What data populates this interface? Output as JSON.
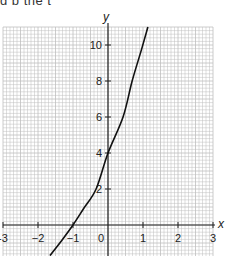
{
  "top_text": "g       p         the   t",
  "chart_data": {
    "type": "line",
    "title": "",
    "xlabel": "x",
    "ylabel": "y",
    "xlim": [
      -3,
      3
    ],
    "ylim": [
      -1.7,
      11
    ],
    "grid": true,
    "x_ticks": [
      -3,
      -2,
      -1,
      0,
      1,
      2,
      3
    ],
    "x_tick_labels": [
      "-3",
      "−2",
      "−1",
      "0",
      "1",
      "2",
      "3"
    ],
    "y_ticks": [
      2,
      4,
      6,
      8,
      10
    ],
    "y_tick_labels": [
      "2",
      "4",
      "6",
      "8",
      "10"
    ],
    "series": [
      {
        "name": "curve",
        "x": [
          -1.66,
          -1.3,
          -1.0,
          -0.7,
          -0.34,
          0.0,
          0.43,
          0.69,
          0.95,
          1.14
        ],
        "y": [
          -1.7,
          -0.8,
          0.0,
          0.9,
          2.0,
          4.0,
          6.0,
          8.0,
          9.7,
          11.0
        ]
      }
    ],
    "colors": {
      "grid": "#bfbfbf",
      "axis": "#222222",
      "curve": "#111111"
    }
  }
}
